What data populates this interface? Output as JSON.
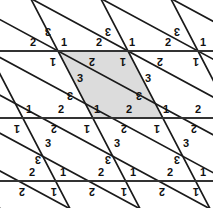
{
  "figure": {
    "canvas": {
      "width": 213,
      "height": 208
    },
    "colors": {
      "background": "#ffffff",
      "line": "#1a1a1a",
      "horizontal_line": "#333333",
      "shaded_region": "#dcdcdc",
      "shaded_region_stroke": "#1a1a1a",
      "label_text": "#111111"
    },
    "geometry": {
      "horizontal_lines_y": [
        51,
        118,
        181
      ],
      "vertex_spacing_x": 70,
      "row_offset_x": -36,
      "row0_vertices_x": [
        58,
        128,
        197
      ],
      "row1_vertices_x": [
        22,
        92,
        162
      ],
      "row2_vertices_x": [
        57,
        127,
        197
      ],
      "steep_slope_dx_dy": 0.52,
      "shallow_slope_dx_dy": 1.85
    },
    "shaded_polygon": [
      {
        "x": 58,
        "y": 51
      },
      {
        "x": 128,
        "y": 51
      },
      {
        "x": 162,
        "y": 118
      },
      {
        "x": 92,
        "y": 118
      }
    ]
  },
  "labels": [
    {
      "text": "2",
      "x": 33,
      "y": 42,
      "flipped": false,
      "name": "angle-label-2"
    },
    {
      "text": "3",
      "x": 48,
      "y": 31,
      "flipped": true,
      "name": "angle-label-3"
    },
    {
      "text": "1",
      "x": 64,
      "y": 42,
      "flipped": false,
      "name": "angle-label-1"
    },
    {
      "text": "1",
      "x": 53,
      "y": 61,
      "flipped": true,
      "name": "angle-label-1"
    },
    {
      "text": "2",
      "x": 92,
      "y": 61,
      "flipped": true,
      "name": "angle-label-2"
    },
    {
      "text": "2",
      "x": 99,
      "y": 42,
      "flipped": false,
      "name": "angle-label-2"
    },
    {
      "text": "3",
      "x": 108,
      "y": 31,
      "flipped": true,
      "name": "angle-label-3"
    },
    {
      "text": "1",
      "x": 132,
      "y": 42,
      "flipped": false,
      "name": "angle-label-1"
    },
    {
      "text": "1",
      "x": 123,
      "y": 61,
      "flipped": true,
      "name": "angle-label-1"
    },
    {
      "text": "2",
      "x": 160,
      "y": 61,
      "flipped": true,
      "name": "angle-label-2"
    },
    {
      "text": "2",
      "x": 168,
      "y": 42,
      "flipped": false,
      "name": "angle-label-2"
    },
    {
      "text": "3",
      "x": 177,
      "y": 31,
      "flipped": true,
      "name": "angle-label-3"
    },
    {
      "text": "1",
      "x": 203,
      "y": 42,
      "flipped": false,
      "name": "angle-label-1"
    },
    {
      "text": "1",
      "x": 196,
      "y": 61,
      "flipped": true,
      "name": "angle-label-1"
    },
    {
      "text": "3",
      "x": 80,
      "y": 78,
      "flipped": false,
      "name": "angle-label-3"
    },
    {
      "text": "3",
      "x": 70,
      "y": 95,
      "flipped": true,
      "name": "angle-label-3"
    },
    {
      "text": "3",
      "x": 148,
      "y": 78,
      "flipped": false,
      "name": "angle-label-3"
    },
    {
      "text": "3",
      "x": 139,
      "y": 95,
      "flipped": true,
      "name": "angle-label-3"
    },
    {
      "text": "1",
      "x": 29,
      "y": 109,
      "flipped": false,
      "name": "angle-label-1"
    },
    {
      "text": "2",
      "x": 61,
      "y": 109,
      "flipped": false,
      "name": "angle-label-2"
    },
    {
      "text": "1",
      "x": 17,
      "y": 128,
      "flipped": true,
      "name": "angle-label-1"
    },
    {
      "text": "2",
      "x": 54,
      "y": 128,
      "flipped": true,
      "name": "angle-label-2"
    },
    {
      "text": "1",
      "x": 97,
      "y": 109,
      "flipped": false,
      "name": "angle-label-1"
    },
    {
      "text": "2",
      "x": 129,
      "y": 109,
      "flipped": false,
      "name": "angle-label-2"
    },
    {
      "text": "1",
      "x": 87,
      "y": 128,
      "flipped": true,
      "name": "angle-label-1"
    },
    {
      "text": "2",
      "x": 124,
      "y": 128,
      "flipped": true,
      "name": "angle-label-2"
    },
    {
      "text": "1",
      "x": 166,
      "y": 109,
      "flipped": false,
      "name": "angle-label-1"
    },
    {
      "text": "2",
      "x": 198,
      "y": 109,
      "flipped": false,
      "name": "angle-label-2"
    },
    {
      "text": "1",
      "x": 157,
      "y": 128,
      "flipped": true,
      "name": "angle-label-1"
    },
    {
      "text": "2",
      "x": 194,
      "y": 128,
      "flipped": true,
      "name": "angle-label-2"
    },
    {
      "text": "3",
      "x": 48,
      "y": 143,
      "flipped": false,
      "name": "angle-label-3"
    },
    {
      "text": "3",
      "x": 38,
      "y": 159,
      "flipped": true,
      "name": "angle-label-3"
    },
    {
      "text": "3",
      "x": 117,
      "y": 143,
      "flipped": false,
      "name": "angle-label-3"
    },
    {
      "text": "3",
      "x": 108,
      "y": 159,
      "flipped": true,
      "name": "angle-label-3"
    },
    {
      "text": "3",
      "x": 186,
      "y": 143,
      "flipped": false,
      "name": "angle-label-3"
    },
    {
      "text": "3",
      "x": 177,
      "y": 159,
      "flipped": true,
      "name": "angle-label-3"
    },
    {
      "text": "2",
      "x": 32,
      "y": 172,
      "flipped": false,
      "name": "angle-label-2"
    },
    {
      "text": "1",
      "x": 63,
      "y": 172,
      "flipped": false,
      "name": "angle-label-1"
    },
    {
      "text": "2",
      "x": 101,
      "y": 172,
      "flipped": false,
      "name": "angle-label-2"
    },
    {
      "text": "1",
      "x": 133,
      "y": 172,
      "flipped": false,
      "name": "angle-label-1"
    },
    {
      "text": "2",
      "x": 170,
      "y": 172,
      "flipped": false,
      "name": "angle-label-2"
    },
    {
      "text": "1",
      "x": 203,
      "y": 172,
      "flipped": false,
      "name": "angle-label-1"
    },
    {
      "text": "2",
      "x": 22,
      "y": 191,
      "flipped": true,
      "name": "angle-label-2"
    },
    {
      "text": "1",
      "x": 54,
      "y": 191,
      "flipped": true,
      "name": "angle-label-1"
    },
    {
      "text": "2",
      "x": 92,
      "y": 191,
      "flipped": true,
      "name": "angle-label-2"
    },
    {
      "text": "1",
      "x": 124,
      "y": 191,
      "flipped": true,
      "name": "angle-label-1"
    },
    {
      "text": "2",
      "x": 162,
      "y": 191,
      "flipped": true,
      "name": "angle-label-2"
    },
    {
      "text": "1",
      "x": 196,
      "y": 191,
      "flipped": true,
      "name": "angle-label-1"
    }
  ]
}
